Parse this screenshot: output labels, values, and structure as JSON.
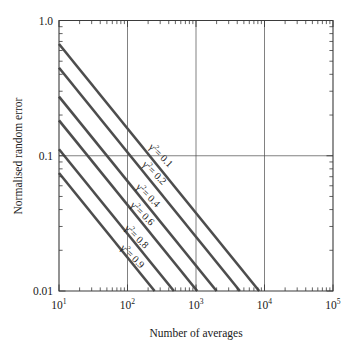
{
  "chart_data": {
    "type": "line",
    "title": "",
    "xlabel": "Number of averages",
    "ylabel": "Normalised random error",
    "xscale": "log",
    "yscale": "log",
    "xlim": [
      10,
      100000
    ],
    "ylim": [
      0.01,
      1.0
    ],
    "grid": true,
    "grid_x_values": [
      100,
      1000,
      10000
    ],
    "grid_y_values": [
      0.1
    ],
    "legend_position": "inline-along-curves",
    "xticklabels": [
      "10¹",
      "10²",
      "10³",
      "10⁴",
      "10⁵"
    ],
    "xtickvalues": [
      10,
      100,
      1000,
      10000,
      100000
    ],
    "yticklabels": [
      "1.0",
      "0.1",
      "0.01"
    ],
    "ytickvalues": [
      1.0,
      0.1,
      0.01
    ],
    "equation": "error = sqrt(1 - g2) / ( sqrt(g2) * sqrt(2n) )",
    "series": [
      {
        "name": "γ² = 0.1",
        "gamma2": 0.1,
        "label_x": 260,
        "points_x": [
          10,
          100000
        ],
        "points_y": [
          0.67082,
          0.0021213
        ]
      },
      {
        "name": "γ² = 0.2",
        "gamma2": 0.2,
        "label_x": 210,
        "points_x": [
          10,
          100000
        ],
        "points_y": [
          0.44721,
          0.0014142
        ]
      },
      {
        "name": "γ² = 0.4",
        "gamma2": 0.4,
        "label_x": 170,
        "points_x": [
          10,
          100000
        ],
        "points_y": [
          0.27386,
          0.00086603
        ]
      },
      {
        "name": "γ² = 0.6",
        "gamma2": 0.6,
        "label_x": 140,
        "points_x": [
          10,
          100000
        ],
        "points_y": [
          0.18257,
          0.00057735
        ]
      },
      {
        "name": "γ² = 0.8",
        "gamma2": 0.8,
        "label_x": 115,
        "points_x": [
          10,
          100000
        ],
        "points_y": [
          0.111803,
          0.00035355
        ]
      },
      {
        "name": "γ² = 0.9",
        "gamma2": 0.9,
        "label_x": 100,
        "points_x": [
          10,
          100000
        ],
        "points_y": [
          0.074536,
          0.0002357
        ]
      }
    ],
    "series_labels": [
      "γ² = 0.1",
      "γ² = 0.2",
      "γ² = 0.4",
      "γ² = 0.6",
      "γ² = 0.8",
      "γ² = 0.9"
    ],
    "series_label_base": "γ",
    "series_label_sup": "2",
    "series_label_values": [
      "= 0.1",
      "= 0.2",
      "= 0.4",
      "= 0.6",
      "= 0.8",
      "= 0.9"
    ],
    "colors": {
      "line": "#4d4d4d",
      "axis": "#3b3b3b",
      "grid": "#4a4a4a",
      "text": "#1a1a1a",
      "background": "#ffffff"
    }
  }
}
